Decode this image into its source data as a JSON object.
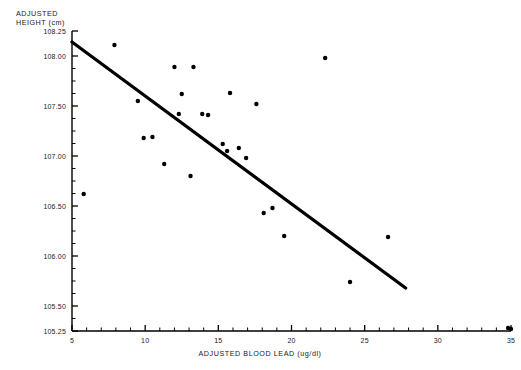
{
  "chart_data": {
    "type": "scatter",
    "title": "",
    "xlabel": "ADJUSTED BLOOD LEAD  (ug/dl)",
    "ylabel_line1": "ADJUSTED",
    "ylabel_line2": "HEIGHT (cm)",
    "xlim": [
      5,
      35
    ],
    "ylim": [
      105.25,
      108.25
    ],
    "grid": false,
    "legend": "none",
    "x_major_ticks": [
      5,
      10,
      15,
      20,
      25,
      30,
      35
    ],
    "x_major_tick_labels": [
      "5",
      "10",
      "15",
      "20",
      "25",
      "30",
      "35"
    ],
    "x_minor_tick_step": 1,
    "y_major_ticks": [
      105.25,
      105.5,
      106.0,
      106.5,
      107.0,
      107.5,
      108.0,
      108.25
    ],
    "y_major_tick_labels": [
      "105.25",
      "105.50",
      "106.00",
      "106.50",
      "107.00",
      "107.50",
      "108.00",
      "108.25"
    ],
    "y_minor_tick_step": 0.125,
    "marker": "filled-circle",
    "marker_color": "#000000",
    "marker_size_px": 3.4,
    "points": [
      {
        "x": 5.8,
        "y": 106.62
      },
      {
        "x": 7.9,
        "y": 108.11
      },
      {
        "x": 9.5,
        "y": 107.55
      },
      {
        "x": 9.9,
        "y": 107.18
      },
      {
        "x": 10.5,
        "y": 107.19
      },
      {
        "x": 11.3,
        "y": 106.92
      },
      {
        "x": 12.0,
        "y": 107.89
      },
      {
        "x": 12.3,
        "y": 107.42
      },
      {
        "x": 12.5,
        "y": 107.62
      },
      {
        "x": 13.1,
        "y": 106.8
      },
      {
        "x": 13.3,
        "y": 107.89
      },
      {
        "x": 13.9,
        "y": 107.42
      },
      {
        "x": 14.3,
        "y": 107.41
      },
      {
        "x": 15.3,
        "y": 107.12
      },
      {
        "x": 15.6,
        "y": 107.05
      },
      {
        "x": 15.8,
        "y": 107.63
      },
      {
        "x": 16.4,
        "y": 107.08
      },
      {
        "x": 16.9,
        "y": 106.98
      },
      {
        "x": 17.6,
        "y": 107.52
      },
      {
        "x": 18.1,
        "y": 106.43
      },
      {
        "x": 18.7,
        "y": 106.48
      },
      {
        "x": 19.5,
        "y": 106.2
      },
      {
        "x": 22.3,
        "y": 107.98
      },
      {
        "x": 24.0,
        "y": 105.74
      },
      {
        "x": 26.6,
        "y": 106.19
      },
      {
        "x": 34.8,
        "y": 105.28
      },
      {
        "x": 35.0,
        "y": 105.27
      }
    ],
    "fit_line": {
      "label": "regression-line",
      "x_start": 5.0,
      "y_start": 108.14,
      "x_end": 27.8,
      "y_end": 105.68,
      "color": "#000000",
      "width_px": 3.2
    }
  }
}
